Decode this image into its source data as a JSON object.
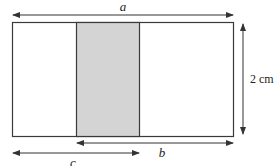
{
  "diagram": {
    "labels": {
      "a": "a",
      "b": "b",
      "c": "c",
      "height": "2 cm"
    },
    "colors": {
      "outline": "#3a3a3a",
      "shade": "#d4d4d4",
      "arrow": "#333333"
    }
  }
}
